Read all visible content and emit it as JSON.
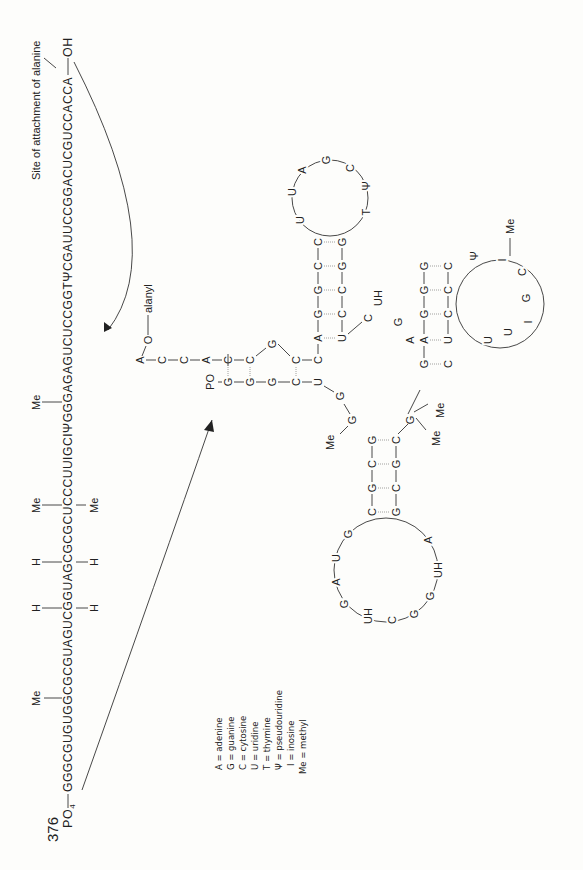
{
  "page_number": "376",
  "header": {
    "site_label": "Site of attachment of alanine"
  },
  "linear_sequence": {
    "five_prime": "PO",
    "five_prime_sub": "4",
    "sequence": "GGGCGUGUGGCGCGUAGUCGGUAGCGCGCUCCCUUIGCIΨGGGAGAGUCUCCGGTΨCGAUUCCGGACUCGUCCACCA",
    "three_prime": "OH",
    "modifications": [
      {
        "label": "Me",
        "side": "above",
        "index": 10
      },
      {
        "label": "H",
        "side": "above",
        "index": 17
      },
      {
        "label": "H",
        "side": "below",
        "index": 17
      },
      {
        "label": "H",
        "side": "above",
        "index": 22
      },
      {
        "label": "H",
        "side": "below",
        "index": 22
      },
      {
        "label": "Me",
        "side": "above",
        "index": 27
      },
      {
        "label": "Me",
        "side": "below",
        "index": 27
      },
      {
        "label": "Me",
        "side": "above",
        "index": 38
      }
    ]
  },
  "cloverleaf": {
    "acceptor_tail": [
      "A",
      "C",
      "C",
      "A"
    ],
    "alanyl_label": "alanyl",
    "o_label": "O",
    "five_prime_label": "PO",
    "five_prime_sub": "4",
    "acceptor_stem_top": [
      "C",
      "C",
      "G",
      "C"
    ],
    "acceptor_stem_bottom": [
      "G",
      "G",
      "G",
      "C"
    ],
    "t_stem_left": [
      "A",
      "G",
      "G",
      "C"
    ],
    "t_stem_right": [
      "U",
      "C",
      "C",
      "G"
    ],
    "t_loop": [
      "U",
      "U",
      "A",
      "G",
      "C",
      "Ψ",
      "T"
    ],
    "variable_loop": [
      "C",
      "UH",
      "G",
      "A"
    ],
    "anticodon_stem_top": [
      "G",
      "A",
      "G",
      "G",
      "G"
    ],
    "anticodon_stem_bottom": [
      "C",
      "U",
      "C",
      "C",
      "C"
    ],
    "anticodon_loop": [
      "Ψ",
      "I",
      "C",
      "G",
      "I",
      "U",
      "U"
    ],
    "d_stem_top": [
      "G",
      "C",
      "G",
      "C"
    ],
    "d_stem_bottom": [
      "C",
      "G",
      "C",
      "G"
    ],
    "d_loop": [
      "G",
      "U",
      "A",
      "G",
      "UH",
      "C",
      "G",
      "G",
      "UH",
      "A"
    ],
    "junction": [
      "U",
      "G",
      "G"
    ],
    "me_labels": [
      "Me",
      "Me",
      "Me",
      "Me"
    ]
  },
  "legend": [
    {
      "symbol": "A",
      "meaning": "adenine"
    },
    {
      "symbol": "G",
      "meaning": "guanine"
    },
    {
      "symbol": "C",
      "meaning": "cytosine"
    },
    {
      "symbol": "U",
      "meaning": "uridine"
    },
    {
      "symbol": "T",
      "meaning": "thymine"
    },
    {
      "symbol": "Ψ",
      "meaning": "pseudouridine"
    },
    {
      "symbol": "I",
      "meaning": "inosine"
    },
    {
      "symbol": "Me",
      "meaning": "methyl"
    }
  ]
}
